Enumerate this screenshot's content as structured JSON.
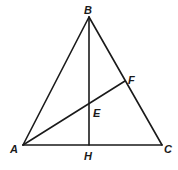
{
  "diagram": {
    "type": "geometry-triangle",
    "points": {
      "A": {
        "label": "A",
        "x": 23,
        "y": 145
      },
      "B": {
        "label": "B",
        "x": 89,
        "y": 17
      },
      "C": {
        "label": "C",
        "x": 162,
        "y": 145
      },
      "H": {
        "label": "H",
        "x": 89,
        "y": 145
      },
      "E": {
        "label": "E",
        "x": 89,
        "y": 103
      },
      "F": {
        "label": "F",
        "x": 125,
        "y": 81
      }
    },
    "segments": [
      "AB",
      "BC",
      "CA",
      "BH",
      "AF"
    ],
    "line_color": "#1a1a1a",
    "background": "#ffffff"
  }
}
